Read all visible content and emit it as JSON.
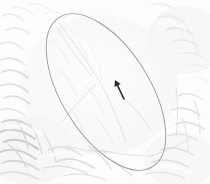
{
  "figure": {
    "name": "terrain-hillshade-map-with-ellipse-overlay",
    "width": 210,
    "height": 184,
    "background_color": "#fdfdfd",
    "base_layer_label": "hillshade-relief",
    "description_label": "Grayscale shaded-relief terrain with elliptical area-of-interest overlay and a directional vector marker"
  },
  "colors": {
    "canvas": "#fdfdfd",
    "terrain_light": "#fbfbfa",
    "terrain_mid": "#e9e9e7",
    "terrain_shadow": "#cfcfcc",
    "terrain_deep_shadow": "#b4b4b0",
    "ellipse_stroke": "#a39a92",
    "faint_line": "#d8d6d2",
    "arrow": "#2b2b2b"
  },
  "ellipse": {
    "label": "area-of-interest-ellipse",
    "center_x": 106,
    "center_y": 92,
    "semi_major": 88,
    "semi_minor": 44,
    "rotation_deg": 58,
    "stroke_color": "#a39a92",
    "stroke_width": 0.9,
    "fill": "none"
  },
  "arrow": {
    "label": "direction-vector-marker",
    "tail_x": 124,
    "tail_y": 99,
    "tip_x": 115,
    "tip_y": 80,
    "bearing_label": "NNW",
    "color": "#2b2b2b",
    "stroke_width": 1.6
  },
  "terrain": {
    "ridges_label": "ridge-lines",
    "valleys_label": "valley-shadows",
    "drainage_label": "drainage-traces"
  },
  "annotations": {
    "scale_bar": "",
    "north_arrow": "",
    "legend": "",
    "title": ""
  }
}
